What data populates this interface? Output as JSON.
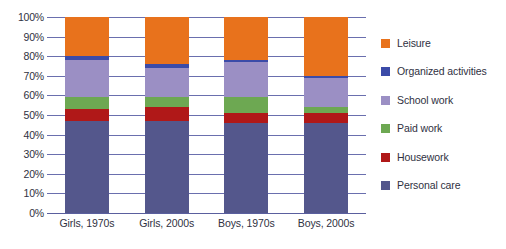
{
  "chart_data": {
    "type": "bar",
    "subtype": "stacked-percentage-column",
    "title": "",
    "xlabel": "",
    "ylabel": "",
    "ylim": [
      0,
      100
    ],
    "yticks": [
      "0%",
      "10%",
      "20%",
      "30%",
      "40%",
      "50%",
      "60%",
      "70%",
      "80%",
      "90%",
      "100%"
    ],
    "ytick_values": [
      0,
      10,
      20,
      30,
      40,
      50,
      60,
      70,
      80,
      90,
      100
    ],
    "grid": true,
    "legend_position": "right",
    "categories": [
      "Girls, 1970s",
      "Girls, 2000s",
      "Boys, 1970s",
      "Boys, 2000s"
    ],
    "series": [
      {
        "name": "Personal care",
        "color": "#54578c",
        "values": [
          47,
          47,
          46,
          46
        ]
      },
      {
        "name": "Housework",
        "color": "#b01818",
        "values": [
          6,
          7,
          5,
          5
        ]
      },
      {
        "name": "Paid work",
        "color": "#6da852",
        "values": [
          6,
          5,
          8,
          3
        ]
      },
      {
        "name": "School work",
        "color": "#9b8fc4",
        "values": [
          19,
          15,
          18,
          15
        ]
      },
      {
        "name": "Organized activities",
        "color": "#3b4ba8",
        "values": [
          2,
          2,
          1,
          1
        ]
      },
      {
        "name": "Leisure",
        "color": "#e8721c",
        "values": [
          20,
          24,
          22,
          30
        ]
      }
    ],
    "legend_entries": [
      "Leisure",
      "Organized activities",
      "School work",
      "Paid work",
      "Housework",
      "Personal care"
    ],
    "colors": {
      "leisure": "#e8721c",
      "organized_activities": "#3b4ba8",
      "school_work": "#9b8fc4",
      "paid_work": "#6da852",
      "housework": "#b01818",
      "personal_care": "#54578c",
      "gridline": "#6a6fae",
      "text": "#2f3142",
      "background": "#ffffff"
    }
  }
}
